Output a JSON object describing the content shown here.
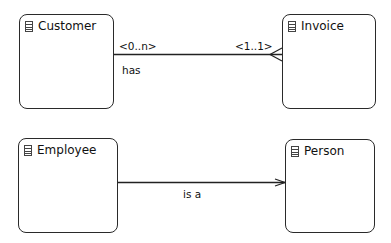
{
  "diagram": {
    "type": "entity-relationship",
    "entities": [
      {
        "id": "customer",
        "name": "Customer",
        "icon": "table-icon"
      },
      {
        "id": "invoice",
        "name": "Invoice",
        "icon": "table-icon"
      },
      {
        "id": "employee",
        "name": "Employee",
        "icon": "table-icon"
      },
      {
        "id": "person",
        "name": "Person",
        "icon": "table-icon"
      }
    ],
    "relationships": [
      {
        "from": "Customer",
        "to": "Invoice",
        "source_cardinality": "<0..n>",
        "target_cardinality": "<1..1>",
        "label": "has",
        "end_marker": "crows-foot"
      },
      {
        "from": "Employee",
        "to": "Person",
        "label": "is a",
        "end_marker": "open-arrow"
      }
    ]
  }
}
